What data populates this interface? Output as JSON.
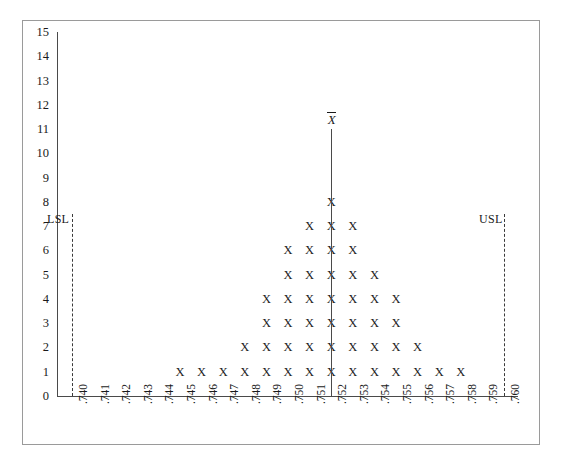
{
  "chart_data": {
    "type": "bar",
    "title": "",
    "subtitle": "",
    "xlabel": "",
    "ylabel": "",
    "mark_glyph": "X",
    "grid": false,
    "legend": "none",
    "xlim": [
      0.74,
      0.76
    ],
    "ylim": [
      0,
      15
    ],
    "x_tick_step": 0.001,
    "y_tick_step": 1,
    "categories": [
      ".740",
      ".741",
      ".742",
      ".743",
      ".744",
      ".745",
      ".746",
      ".747",
      ".748",
      ".749",
      ".750",
      ".751",
      ".752",
      ".753",
      ".754",
      ".755",
      ".756",
      ".757",
      ".758",
      ".759",
      ".760"
    ],
    "values": [
      0,
      0,
      0,
      0,
      0,
      1,
      1,
      1,
      2,
      4,
      6,
      7,
      8,
      7,
      5,
      4,
      2,
      1,
      1,
      0,
      0
    ],
    "y_tick_labels": [
      "0",
      "1",
      "2",
      "3",
      "4",
      "5",
      "6",
      "7",
      "8",
      "9",
      "10",
      "11",
      "12",
      "13",
      "14",
      "15"
    ],
    "annotations": [
      {
        "name": "lsl",
        "label": "LSL",
        "x": ".740",
        "style": "dashed-vertical"
      },
      {
        "name": "usl",
        "label": "USL",
        "x": ".760",
        "style": "dashed-vertical"
      },
      {
        "name": "mean",
        "label": "X̄",
        "x": ".752",
        "style": "solid-vertical",
        "height": 11
      }
    ],
    "total_count": 40
  },
  "labels": {
    "lsl": "LSL",
    "usl": "USL",
    "mean": "X"
  }
}
